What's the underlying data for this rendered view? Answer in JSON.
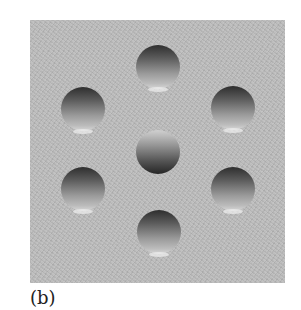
{
  "figure": {
    "panel_label": "(b)",
    "background_color": "#bdbdbd",
    "dimples": [
      {
        "id": "top",
        "cx": 158,
        "cy": 67,
        "r": 22,
        "shading": "dark-top"
      },
      {
        "id": "upper-left",
        "cx": 83,
        "cy": 109,
        "r": 22,
        "shading": "dark-top"
      },
      {
        "id": "upper-right",
        "cx": 233,
        "cy": 108,
        "r": 22,
        "shading": "dark-top"
      },
      {
        "id": "center",
        "cx": 158,
        "cy": 152,
        "r": 22,
        "shading": "dark-bottom"
      },
      {
        "id": "lower-left",
        "cx": 83,
        "cy": 189,
        "r": 22,
        "shading": "dark-top"
      },
      {
        "id": "lower-right",
        "cx": 233,
        "cy": 189,
        "r": 22,
        "shading": "dark-top"
      },
      {
        "id": "bottom",
        "cx": 159,
        "cy": 232,
        "r": 22,
        "shading": "dark-top"
      }
    ]
  }
}
